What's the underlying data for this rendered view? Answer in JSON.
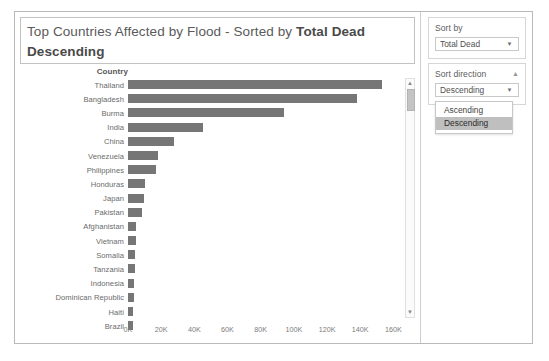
{
  "chart": {
    "title_prefix": "Top Countries Affected by Flood - Sorted by ",
    "title_emphasis": "Total Dead Descending",
    "axis_header": "Country",
    "scroll": {
      "up_icon": "chevron-up-icon",
      "down_icon": "chevron-down-icon"
    }
  },
  "controls": {
    "sort_by": {
      "label": "Sort by",
      "value": "Total Dead",
      "caret_icon": "chevron-down-icon"
    },
    "sort_direction": {
      "label": "Sort direction",
      "value": "Descending",
      "caret_icon": "chevron-down-icon",
      "collapse_icon": "chevron-up-icon",
      "options": [
        {
          "label": "Ascending",
          "selected": false
        },
        {
          "label": "Descending",
          "selected": true
        }
      ]
    }
  },
  "chart_data": {
    "type": "bar",
    "orientation": "horizontal",
    "title": "Top Countries Affected by Flood - Sorted by Total Dead Descending",
    "xlabel": "",
    "ylabel": "Country",
    "xlim": [
      0,
      170000
    ],
    "grid": false,
    "legend": null,
    "bar_color": "#767676",
    "tick_labels": [
      "0K",
      "20K",
      "40K",
      "60K",
      "80K",
      "100K",
      "120K",
      "140K",
      "160K"
    ],
    "tick_values": [
      0,
      20000,
      40000,
      60000,
      80000,
      100000,
      120000,
      140000,
      160000
    ],
    "categories": [
      "Thailand",
      "Bangladesh",
      "Burma",
      "India",
      "China",
      "Venezuela",
      "Philippines",
      "Honduras",
      "Japan",
      "Pakistan",
      "Afghanistan",
      "Vietnam",
      "Somalia",
      "Tanzania",
      "Indonesia",
      "Dominican Republic",
      "Haiti",
      "Brazil"
    ],
    "values": [
      153000,
      138000,
      94000,
      45000,
      28000,
      18000,
      17000,
      10000,
      9500,
      8500,
      5000,
      4800,
      4500,
      4000,
      3800,
      3500,
      3200,
      3000
    ]
  }
}
